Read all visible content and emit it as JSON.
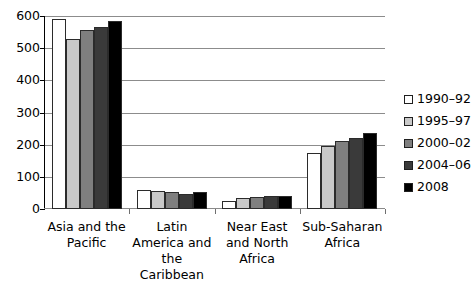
{
  "chart_data": {
    "type": "bar",
    "title": "",
    "subtitle": "",
    "xlabel": "",
    "ylabel": "",
    "ylim": [
      0,
      600
    ],
    "ytick_step": 100,
    "ytick_labels": [
      "600",
      "500",
      "400",
      "300",
      "200",
      "100",
      "0"
    ],
    "ytick_values": [
      600,
      500,
      400,
      300,
      200,
      100,
      0
    ],
    "grid": true,
    "grid_axis": "y",
    "legend_position": "right",
    "categories": [
      "Asia and the Pacific",
      "Latin America and the Caribbean",
      "Near East and North Africa",
      "Sub-Saharan Africa"
    ],
    "series": [
      {
        "name": "1990–92",
        "color": "#ffffff",
        "values": [
          590,
          58,
          25,
          175
        ]
      },
      {
        "name": "1995–97",
        "color": "#c9c9c9",
        "values": [
          530,
          57,
          33,
          197
        ]
      },
      {
        "name": "2000–02",
        "color": "#7f7f7f",
        "values": [
          555,
          54,
          36,
          210
        ]
      },
      {
        "name": "2004–06",
        "color": "#3a3a3a",
        "values": [
          567,
          48,
          40,
          222
        ]
      },
      {
        "name": "2008",
        "color": "#000000",
        "values": [
          585,
          53,
          42,
          235
        ]
      }
    ]
  }
}
